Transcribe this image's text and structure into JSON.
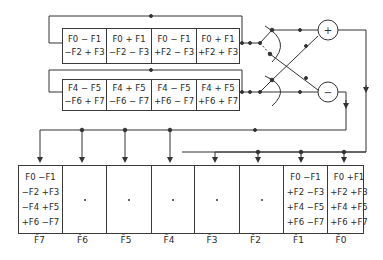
{
  "diagram": {
    "register_a": {
      "cells": [
        {
          "line1": "F0 − F1",
          "line2": "−F2 + F3"
        },
        {
          "line1": "F0 + F1",
          "line2": "−F2 − F3"
        },
        {
          "line1": "F0 − F1",
          "line2": "+F2 − F3"
        },
        {
          "line1": "F0 + F1",
          "line2": "+F2 + F3"
        }
      ]
    },
    "register_b": {
      "cells": [
        {
          "line1": "F4 − F5",
          "line2": "−F6 + F7"
        },
        {
          "line1": "F4 + F5",
          "line2": "−F6 − F7"
        },
        {
          "line1": "F4 − F5",
          "line2": "+F6 − F7"
        },
        {
          "line1": "F4 + F5",
          "line2": "+F6 + F7"
        }
      ]
    },
    "adders": {
      "plus": "+",
      "minus": "−"
    },
    "output_register": {
      "cells": [
        {
          "lines": [
            "F0  −F1",
            "−F2 +F3",
            "−F4 +F5",
            "+F6 −F7"
          ],
          "label": "F̂7"
        },
        {
          "lines": [
            "·"
          ],
          "label": "F̂6"
        },
        {
          "lines": [
            "·"
          ],
          "label": "F̂5"
        },
        {
          "lines": [
            "·"
          ],
          "label": "F̂4"
        },
        {
          "lines": [
            "·"
          ],
          "label": "F̂3"
        },
        {
          "lines": [
            "·"
          ],
          "label": "F̂2"
        },
        {
          "lines": [
            "F0 −F1",
            "+F2 −F3",
            "+F4 −F5",
            "+F6 −F7"
          ],
          "label": "F̂1"
        },
        {
          "lines": [
            "F0 +F1",
            "+F2 +F3",
            "+F4 +F5",
            "+F6 +F7"
          ],
          "label": "F̂0"
        }
      ]
    }
  }
}
